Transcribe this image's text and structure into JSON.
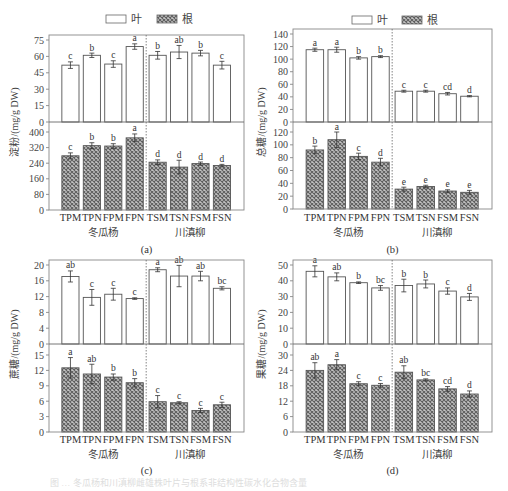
{
  "legend": {
    "items": [
      {
        "label": "叶",
        "style": "open",
        "color": "#ffffff"
      },
      {
        "label": "根",
        "style": "hatched",
        "color": "#8a8a8a"
      }
    ]
  },
  "colors": {
    "axis": "#777777",
    "bar_edge": "#555555",
    "hatch_dark": "#6e6e6e",
    "hatch_light": "#c8c8c8",
    "text": "#333333"
  },
  "categories": [
    "TPM",
    "TPN",
    "FPM",
    "FPN",
    "TSM",
    "TSN",
    "FSM",
    "FSN"
  ],
  "groups": [
    {
      "label": "冬瓜杨",
      "span": [
        0,
        3
      ]
    },
    {
      "label": "川滇柳",
      "span": [
        4,
        7
      ]
    }
  ],
  "caption": "图 … 冬瓜杨和川滇柳雌雄株叶片与根系非结构性碳水化合物含量",
  "chart_data": [
    {
      "type": "bar",
      "panel": "(a)",
      "ylabel": "淀粉/(mg/g DW)",
      "categories": [
        "TPM",
        "TPN",
        "FPM",
        "FPN",
        "TSM",
        "TSN",
        "FSM",
        "FSN"
      ],
      "series": [
        {
          "name": "叶",
          "ylim": [
            0,
            75
          ],
          "yticks": [
            0,
            15,
            30,
            45,
            60,
            75
          ],
          "values": [
            52,
            61,
            53,
            69,
            61,
            64,
            63,
            52
          ],
          "errors": [
            3,
            2,
            3,
            2.5,
            3.5,
            6,
            2.5,
            3.5
          ],
          "letters": [
            "c",
            "b",
            "c",
            "a",
            "b",
            "ab",
            "b",
            "c"
          ]
        },
        {
          "name": "根",
          "ylim": [
            0,
            400
          ],
          "yticks": [
            0,
            80,
            160,
            240,
            320,
            400
          ],
          "values": [
            278,
            330,
            328,
            370,
            245,
            220,
            238,
            228
          ],
          "errors": [
            15,
            15,
            12,
            20,
            12,
            35,
            8,
            6
          ],
          "letters": [
            "c",
            "b",
            "b",
            "a",
            "d",
            "d",
            "d",
            "d"
          ]
        }
      ]
    },
    {
      "type": "bar",
      "panel": "(b)",
      "ylabel": "总糖/(mg/g DW)",
      "categories": [
        "TPM",
        "TPN",
        "FPM",
        "FPN",
        "TSM",
        "TSN",
        "FSM",
        "FSN"
      ],
      "series": [
        {
          "name": "叶",
          "ylim": [
            0,
            140
          ],
          "yticks": [
            0,
            20,
            40,
            60,
            80,
            100,
            120,
            140
          ],
          "values": [
            115,
            115,
            102,
            104,
            49,
            49,
            45,
            41
          ],
          "errors": [
            2.5,
            4,
            2,
            1.5,
            1.5,
            1.5,
            2,
            1
          ],
          "letters": [
            "a",
            "a",
            "b",
            "b",
            "c",
            "c",
            "cd",
            "d"
          ]
        },
        {
          "name": "根",
          "ylim": [
            0,
            130
          ],
          "yticks": [
            0,
            20,
            40,
            60,
            80,
            100,
            120
          ],
          "values": [
            92,
            108,
            82,
            73,
            31,
            35,
            28,
            26
          ],
          "errors": [
            6,
            12,
            5,
            6,
            3,
            2,
            2,
            3
          ],
          "letters": [
            "b",
            "a",
            "c",
            "d",
            "e",
            "e",
            "e",
            "e"
          ]
        }
      ]
    },
    {
      "type": "bar",
      "panel": "(c)",
      "ylabel": "蔗糖/(mg/g DW)",
      "categories": [
        "TPM",
        "TPN",
        "FPM",
        "FPN",
        "TSM",
        "TSN",
        "FSM",
        "FSN"
      ],
      "series": [
        {
          "name": "叶",
          "ylim": [
            0,
            21
          ],
          "yticks": [
            0,
            4,
            8,
            12,
            16,
            20
          ],
          "values": [
            17.1,
            11.8,
            12.6,
            11.5,
            18.8,
            17.2,
            17.2,
            14.1
          ],
          "errors": [
            1.4,
            2.0,
            1.5,
            0.2,
            0.5,
            2.7,
            1.2,
            0.4
          ],
          "letters": [
            "ab",
            "c",
            "c",
            "c",
            "a",
            "ab",
            "ab",
            "bc"
          ]
        },
        {
          "name": "根",
          "ylim": [
            0,
            16
          ],
          "yticks": [
            0,
            3,
            6,
            9,
            12,
            15
          ],
          "values": [
            12.5,
            11.3,
            10.7,
            9.6,
            5.9,
            5.7,
            4.2,
            5.3
          ],
          "errors": [
            2.0,
            1.9,
            0.6,
            0.8,
            1.2,
            0.2,
            0.4,
            0.5
          ],
          "letters": [
            "a",
            "ab",
            "b",
            "b",
            "c",
            "c",
            "c",
            "c"
          ]
        }
      ]
    },
    {
      "type": "bar",
      "panel": "(d)",
      "ylabel": "果糖/(mg/g DW)",
      "categories": [
        "TPM",
        "TPN",
        "FPM",
        "FPN",
        "TSM",
        "TSN",
        "FSM",
        "FSN"
      ],
      "series": [
        {
          "name": "叶",
          "ylim": [
            0,
            55
          ],
          "yticks": [
            0,
            10,
            20,
            30,
            40,
            50
          ],
          "values": [
            46,
            42.5,
            38.8,
            35.5,
            37,
            38,
            33.5,
            29.8
          ],
          "errors": [
            3.5,
            2.5,
            0.5,
            1.5,
            4,
            2.5,
            2,
            2.2
          ],
          "letters": [
            "a",
            "ab",
            "b",
            "bc",
            "b",
            "b",
            "c",
            "d"
          ]
        },
        {
          "name": "根",
          "ylim": [
            0,
            32
          ],
          "yticks": [
            0,
            6,
            12,
            18,
            24,
            30
          ],
          "values": [
            24,
            26.2,
            18.8,
            18.2,
            23.3,
            20.3,
            16.8,
            14.8
          ],
          "errors": [
            3,
            2,
            0.8,
            0.7,
            2.5,
            0.4,
            0.9,
            1.2
          ],
          "letters": [
            "ab",
            "a",
            "c",
            "c",
            "ab",
            "bc",
            "cd",
            "d"
          ]
        }
      ]
    }
  ]
}
